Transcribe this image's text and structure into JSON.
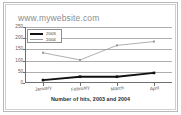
{
  "chart_title": "www.mywebsite.com",
  "caption": "Number of hits, 2003 and 2004",
  "legend": {
    "items": [
      {
        "label": "2003",
        "color": "#111111"
      },
      {
        "label": "2004",
        "color": "#9a9a9a"
      }
    ]
  },
  "yticks": [
    "250",
    "200",
    "150",
    "100",
    "50",
    "0"
  ],
  "xticks": [
    "January",
    "February",
    "March",
    "April"
  ],
  "chart_data": {
    "type": "line",
    "title": "www.mywebsite.com",
    "subtitle": "Number of hits, 2003 and 2004",
    "xlabel": "",
    "ylabel": "",
    "categories": [
      "January",
      "February",
      "March",
      "April"
    ],
    "series": [
      {
        "name": "2003",
        "color": "#111111",
        "values": [
          13,
          28,
          28,
          45
        ]
      },
      {
        "name": "2004",
        "color": "#9a9a9a",
        "values": [
          135,
          103,
          168,
          185
        ]
      }
    ],
    "ylim": [
      0,
      250
    ],
    "ytick_values": [
      0,
      50,
      100,
      150,
      200,
      250
    ],
    "grid": true,
    "legend_position": "top-left",
    "markers": "square"
  }
}
